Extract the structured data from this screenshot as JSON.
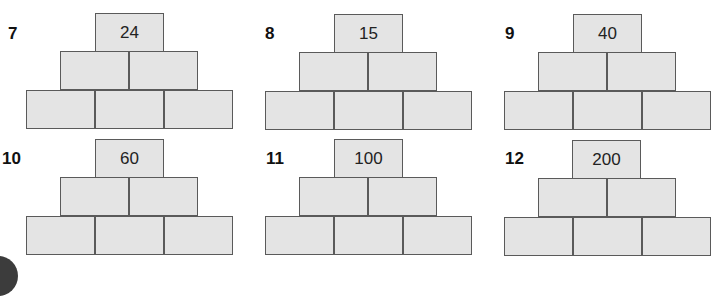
{
  "pyramids": [
    {
      "number": "7",
      "top": "24",
      "middle": [
        "",
        ""
      ],
      "bottom": [
        "",
        "",
        ""
      ]
    },
    {
      "number": "8",
      "top": "15",
      "middle": [
        "",
        ""
      ],
      "bottom": [
        "",
        "",
        ""
      ]
    },
    {
      "number": "9",
      "top": "40",
      "middle": [
        "",
        ""
      ],
      "bottom": [
        "",
        "",
        ""
      ]
    },
    {
      "number": "10",
      "top": "60",
      "middle": [
        "",
        ""
      ],
      "bottom": [
        "",
        "",
        ""
      ]
    },
    {
      "number": "11",
      "top": "100",
      "middle": [
        "",
        ""
      ],
      "bottom": [
        "",
        "",
        ""
      ]
    },
    {
      "number": "12",
      "top": "200",
      "middle": [
        "",
        ""
      ],
      "bottom": [
        "",
        "",
        ""
      ]
    }
  ],
  "colors": {
    "brick_fill": "#e4e4e4",
    "brick_border": "#5a5a5a",
    "corner_circle": "#3c3c3c"
  }
}
